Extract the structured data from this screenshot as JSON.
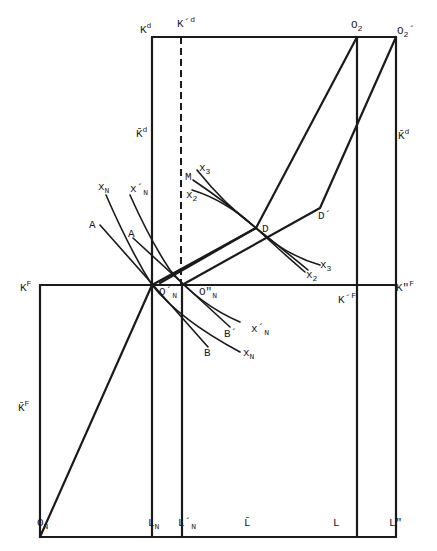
{
  "figure": {
    "type": "edgeworth-box-production-diagram",
    "labels": {
      "K_d": {
        "base": "K",
        "sup": "d"
      },
      "K_prime_d": {
        "base": "K´",
        "sup": "d"
      },
      "O_2": {
        "base": "O",
        "sub": "2"
      },
      "O_2_prime": {
        "base": "O",
        "sub": "2",
        "mark": "´"
      },
      "K_bar_d_left": {
        "base": "K̄",
        "sup": "d"
      },
      "K_bar_d_right": {
        "base": "K̄",
        "sup": "d"
      },
      "x_N": "x",
      "x_N_sub": "N",
      "x_N_prime": "x´",
      "x_N_prime_sub": "N",
      "A": "A",
      "A2": "A",
      "M": "M",
      "x_3": "x",
      "x_3_sub": "3",
      "x_2": "x",
      "x_2_sub": "2",
      "D": "D",
      "D_prime": "D´",
      "x_3_right": "x",
      "x_3_right_sub": "3",
      "x_2_right": "x",
      "x_2_right_sub": "2",
      "K_F": {
        "base": "K",
        "sup": "F"
      },
      "O_N_prime": {
        "base": "O´",
        "sub": "N"
      },
      "O_N_dprime": {
        "base": "O\"",
        "sub": "N"
      },
      "K_prime_F": {
        "base": "K´",
        "sup": "F"
      },
      "K_dprime_F": {
        "base": "K\"",
        "sup": "F"
      },
      "B_prime": "B´",
      "x_N_prime_low": "x´",
      "x_N_prime_low_sub": "N",
      "B": "B",
      "x_N_low": "x",
      "x_N_low_sub": "N",
      "K_bar_F": {
        "base": "K̄",
        "sup": "F"
      },
      "O_N": {
        "base": "O",
        "sub": "N"
      },
      "L_N": {
        "base": "L",
        "sub": "N"
      },
      "L_N_prime": {
        "base": "L´",
        "sub": "N"
      },
      "L_bar": "L̄",
      "L": "L",
      "L_dprime": "L\""
    },
    "points": {
      "O_N": [
        40,
        537
      ],
      "O_N_prime": [
        152,
        285
      ],
      "O_N_dprime": [
        182,
        285
      ],
      "D": [
        256,
        228
      ],
      "D_prime": [
        320,
        208
      ],
      "O_2": [
        357,
        37
      ],
      "O_2_prime": [
        396,
        37
      ]
    }
  }
}
